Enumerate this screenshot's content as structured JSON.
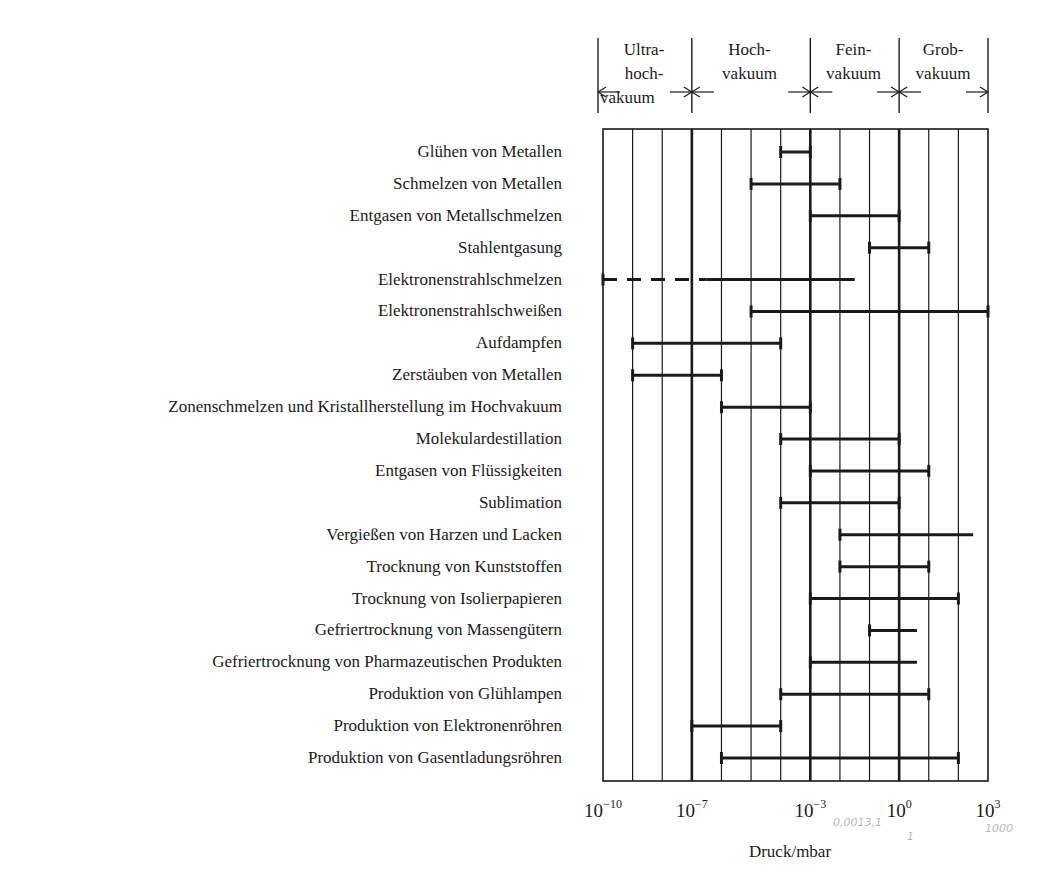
{
  "chart_data": {
    "type": "range-bar",
    "title": "",
    "xlabel": "Druck/mbar",
    "ylabel": "",
    "x_scale": "log10",
    "xlim_exponent": [
      -10,
      3
    ],
    "grid": "vertical lines every decade",
    "x_tick_labels": [
      {
        "exp": -10,
        "text": "10",
        "sup": "-10"
      },
      {
        "exp": -7,
        "text": "10",
        "sup": "-7"
      },
      {
        "exp": -3,
        "text": "10",
        "sup": "-3"
      },
      {
        "exp": 0,
        "text": "10",
        "sup": "0"
      },
      {
        "exp": 3,
        "text": "10",
        "sup": "3"
      }
    ],
    "regions": [
      {
        "name": "Ultrahochvakuum",
        "lines": [
          "Ultra-",
          "hoch-",
          "vakuum"
        ],
        "from_exp": -10,
        "to_exp": -7
      },
      {
        "name": "Hochvakuum",
        "lines": [
          "Hoch-",
          "vakuum"
        ],
        "from_exp": -7,
        "to_exp": -3
      },
      {
        "name": "Feinvakuum",
        "lines": [
          "Fein-",
          "vakuum"
        ],
        "from_exp": -3,
        "to_exp": 0
      },
      {
        "name": "Grobvakuum",
        "lines": [
          "Grob-",
          "vakuum"
        ],
        "from_exp": 0,
        "to_exp": 3
      }
    ],
    "rows": [
      {
        "label": "Glühen von Metallen",
        "from_exp": -4,
        "to_exp": -3
      },
      {
        "label": "Schmelzen von Metallen",
        "from_exp": -5,
        "to_exp": -2
      },
      {
        "label": "Entgasen von Metallschmelzen",
        "from_exp": -3,
        "to_exp": 0
      },
      {
        "label": "Stahlentgasung",
        "from_exp": -1,
        "to_exp": 1
      },
      {
        "label": "Elektronenstrahlschmelzen",
        "from_exp": -10,
        "to_exp": -1.5,
        "dashed_until_exp": -6.5
      },
      {
        "label": "Elektronenstrahlschweißen",
        "from_exp": -5,
        "to_exp": 3
      },
      {
        "label": "Aufdampfen",
        "from_exp": -9,
        "to_exp": -4
      },
      {
        "label": "Zerstäuben von Metallen",
        "from_exp": -9,
        "to_exp": -6
      },
      {
        "label": "Zonenschmelzen und Kristallherstellung im Hochvakuum",
        "from_exp": -6,
        "to_exp": -3
      },
      {
        "label": "Molekulardestillation",
        "from_exp": -4,
        "to_exp": 0
      },
      {
        "label": "Entgasen von Flüssigkeiten",
        "from_exp": -3,
        "to_exp": 1
      },
      {
        "label": "Sublimation",
        "from_exp": -4,
        "to_exp": 0
      },
      {
        "label": "Vergießen von Harzen und Lacken",
        "from_exp": -2,
        "to_exp": 2.5
      },
      {
        "label": "Trocknung von Kunststoffen",
        "from_exp": -2,
        "to_exp": 1
      },
      {
        "label": "Trocknung von Isolierpapieren",
        "from_exp": -3,
        "to_exp": 2
      },
      {
        "label": "Gefriertrocknung von Massengütern",
        "from_exp": -1,
        "to_exp": 0.6
      },
      {
        "label": "Gefriertrocknung von Pharmazeutischen Produkten",
        "from_exp": -3,
        "to_exp": 0.6
      },
      {
        "label": "Produktion von Glühlampen",
        "from_exp": -4,
        "to_exp": 1
      },
      {
        "label": "Produktion von Elektronenröhren",
        "from_exp": -7,
        "to_exp": -4
      },
      {
        "label": "Produktion von Gasentladungsröhren",
        "from_exp": -6,
        "to_exp": 2
      }
    ],
    "pencil_annotations": [
      "0,0013,1",
      "1",
      "1000"
    ]
  },
  "colors": {
    "ink": "#1a1a1a",
    "pencil": "#b8b8b8",
    "background": "#ffffff"
  }
}
